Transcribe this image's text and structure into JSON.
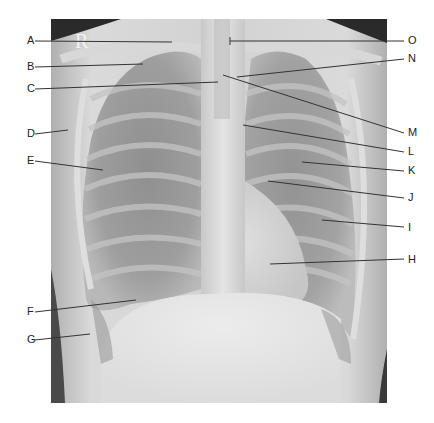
{
  "figure": {
    "type": "Posteroanterior chest radiograph with lettered anatomical labels",
    "side_marker": "R",
    "labels_left": [
      {
        "letter": "A",
        "x": 27,
        "y": 41,
        "line": [
          35,
          41,
          172,
          42
        ]
      },
      {
        "letter": "B",
        "x": 27,
        "y": 67,
        "line": [
          35,
          67,
          143,
          64
        ]
      },
      {
        "letter": "C",
        "x": 27,
        "y": 89,
        "line": [
          35,
          89,
          218,
          82
        ]
      },
      {
        "letter": "D",
        "x": 27,
        "y": 134,
        "line": [
          35,
          134,
          68,
          130
        ]
      },
      {
        "letter": "E",
        "x": 27,
        "y": 161,
        "line": [
          35,
          161,
          103,
          170
        ]
      },
      {
        "letter": "F",
        "x": 27,
        "y": 312,
        "line": [
          35,
          312,
          136,
          300
        ]
      },
      {
        "letter": "G",
        "x": 27,
        "y": 340,
        "line": [
          35,
          340,
          90,
          334
        ]
      }
    ],
    "labels_right": [
      {
        "letter": "O",
        "x": 408,
        "y": 41,
        "line": [
          404,
          41,
          230,
          41
        ],
        "tick": true
      },
      {
        "letter": "N",
        "x": 408,
        "y": 59,
        "line": [
          404,
          59,
          237,
          77
        ]
      },
      {
        "letter": "M",
        "x": 408,
        "y": 133,
        "line": [
          404,
          133,
          223,
          75
        ]
      },
      {
        "letter": "L",
        "x": 408,
        "y": 152,
        "line": [
          404,
          152,
          243,
          125
        ]
      },
      {
        "letter": "K",
        "x": 408,
        "y": 171,
        "line": [
          404,
          171,
          302,
          162
        ]
      },
      {
        "letter": "J",
        "x": 408,
        "y": 198,
        "line": [
          404,
          198,
          268,
          181
        ]
      },
      {
        "letter": "I",
        "x": 408,
        "y": 228,
        "line": [
          404,
          227,
          322,
          220
        ]
      },
      {
        "letter": "H",
        "x": 408,
        "y": 260,
        "line": [
          404,
          259,
          270,
          264
        ]
      }
    ],
    "colors": {
      "leader_line": "#333333",
      "label_text": "#222222",
      "background": "#ffffff"
    }
  }
}
